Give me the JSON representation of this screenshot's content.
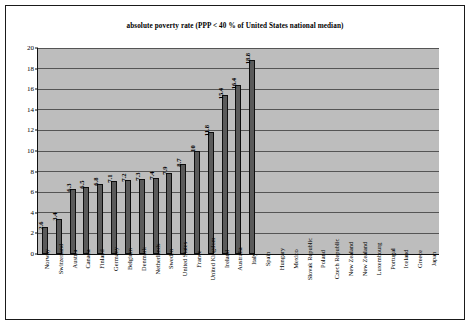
{
  "chart_data": {
    "type": "bar",
    "title": "absolute poverty rate (PPP < 40 % of United States national median)",
    "xlabel": "",
    "ylabel": "",
    "ylim": [
      0,
      20
    ],
    "ytick_step": 2,
    "yticks": [
      "0",
      "2",
      "4",
      "6",
      "8",
      "10",
      "12",
      "14",
      "16",
      "18",
      "20"
    ],
    "grid": true,
    "legend": false,
    "orientation": "vertical",
    "value_labels_rotated": true,
    "categories": [
      "Norway",
      "Switzerland",
      "Austria",
      "Canada",
      "Finland",
      "Germany",
      "Belgium",
      "Denmark",
      "Netherlands",
      "Sweden",
      "United States",
      "France",
      "United Kingdom",
      "Ireland",
      "Australia",
      "Italy",
      "Spain",
      "Hungary",
      "Mexico",
      "Slovak Republic",
      "Poland",
      "Czech Republic",
      "New Zealand",
      "New Zealand",
      "Luxembourg",
      "Portugal",
      "Iceland",
      "Greece",
      "Japan"
    ],
    "values": [
      2.6,
      3.4,
      6.3,
      6.5,
      6.8,
      7.1,
      7.2,
      7.3,
      7.4,
      7.9,
      8.7,
      10,
      11.8,
      15.4,
      16.4,
      18.8,
      null,
      null,
      null,
      null,
      null,
      null,
      null,
      null,
      null,
      null,
      null,
      null,
      null
    ],
    "value_labels": [
      "2.6",
      "3.4",
      "6.3",
      "6.5",
      "6.8",
      "7.1",
      "7.2",
      "7.3",
      "7.4",
      "7.9",
      "8.7",
      "10",
      "11.8",
      "15.4",
      "16.4",
      "18.8",
      "",
      "",
      "",
      "",
      "",
      "",
      "",
      "",
      "",
      "",
      "",
      "",
      ""
    ]
  },
  "colors": {
    "plot_background": "#bdbdbd",
    "page_background": "#ffffff",
    "bar_fill": "#5a5a5a",
    "bar_border": "#0e0e0e",
    "gridline": "#555555",
    "axis": "#111111",
    "text": "#000000",
    "frame_border": "#1a1a1a"
  }
}
